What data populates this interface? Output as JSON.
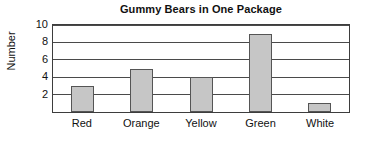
{
  "chart_data": {
    "type": "bar",
    "title": "Gummy Bears in One Package",
    "xlabel": "",
    "ylabel": "Number",
    "categories": [
      "Red",
      "Orange",
      "Yellow",
      "Green",
      "White"
    ],
    "values": [
      3,
      5,
      4,
      9,
      1
    ],
    "ylim": [
      0,
      10
    ],
    "yticks": [
      2,
      4,
      6,
      8,
      10
    ],
    "ytick_labels": [
      "2",
      "4",
      "6",
      "8",
      "10"
    ],
    "grid": "horizontal",
    "legend": "none",
    "bar_color": "#c6c6c6",
    "bar_border_color": "#555555",
    "axis_color": "#3d3d3d",
    "background_color": "#ffffff"
  }
}
